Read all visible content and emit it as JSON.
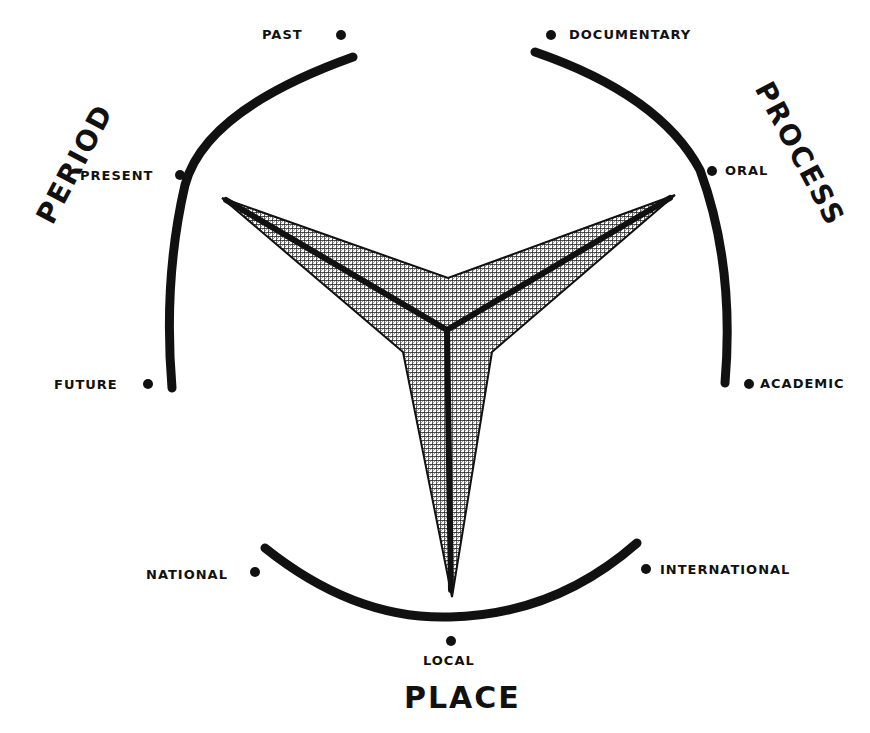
{
  "diagram": {
    "type": "triangular-axis-diagram",
    "center": {
      "x": 447,
      "y": 330
    },
    "colors": {
      "ink": "#111111",
      "background": "#ffffff",
      "hatch": "#222222"
    },
    "axes": [
      {
        "title": "PERIOD",
        "position": "upper-left",
        "points": [
          {
            "label": "PAST",
            "role": "arc-start"
          },
          {
            "label": "PRESENT",
            "role": "arc-middle"
          },
          {
            "label": "FUTURE",
            "role": "arc-end"
          }
        ]
      },
      {
        "title": "PROCESS",
        "position": "upper-right",
        "points": [
          {
            "label": "DOCUMENTARY",
            "role": "arc-start"
          },
          {
            "label": "ORAL",
            "role": "arc-middle"
          },
          {
            "label": "ACADEMIC",
            "role": "arc-end"
          }
        ]
      },
      {
        "title": "PLACE",
        "position": "bottom",
        "points": [
          {
            "label": "NATIONAL",
            "role": "arc-start"
          },
          {
            "label": "LOCAL",
            "role": "arc-middle"
          },
          {
            "label": "INTERNATIONAL",
            "role": "arc-end"
          }
        ]
      }
    ],
    "star": {
      "description": "three-armed cross-hatched star with thick spokes from center to each arm tip",
      "arm_tips": [
        {
          "toward": "PERIOD",
          "x": 222,
          "y": 198
        },
        {
          "toward": "PROCESS",
          "x": 675,
          "y": 195
        },
        {
          "toward": "PLACE",
          "x": 452,
          "y": 597
        }
      ]
    }
  },
  "labels": {
    "period_title": "PERIOD",
    "process_title": "PROCESS",
    "place_title": "PLACE",
    "past": "PAST",
    "present": "PRESENT",
    "future": "FUTURE",
    "documentary": "DOCUMENTARY",
    "oral": "ORAL",
    "academic": "ACADEMIC",
    "national": "NATIONAL",
    "local": "LOCAL",
    "international": "INTERNATIONAL"
  }
}
